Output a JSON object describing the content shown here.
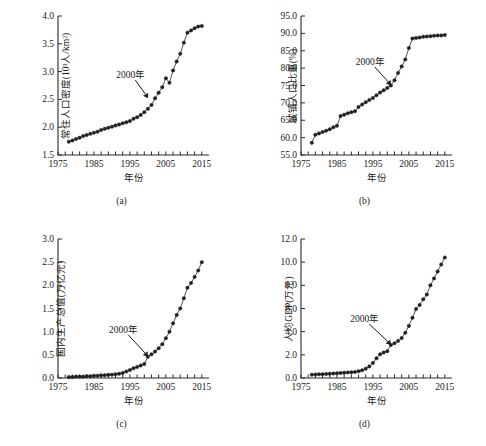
{
  "figure": {
    "panel_captions": [
      "(a)",
      "(b)",
      "(c)",
      "(d)"
    ]
  },
  "chart_data": [
    {
      "type": "scatter",
      "panel": "(a)",
      "title": "",
      "xlabel": "年份",
      "ylabel": "常住人口密度(10³人/km²)",
      "xlim": [
        1975,
        2017
      ],
      "ylim": [
        1.5,
        4.0
      ],
      "xticks": [
        1975,
        1985,
        1995,
        2005,
        2015
      ],
      "xtick_labels": [
        "1975",
        "1985",
        "1995",
        "2005",
        "2015"
      ],
      "yticks": [
        1.5,
        2.0,
        2.5,
        3.0,
        3.5,
        4.0
      ],
      "ytick_labels": [
        "1.5",
        "2.0",
        "2.5",
        "3.0",
        "3.5",
        "4.0"
      ],
      "grid": false,
      "legend": "none",
      "annotations": [
        {
          "text": "2000年",
          "x": 1996.5,
          "y": 2.92,
          "points_to_x": 2000,
          "points_to_y": 2.52
        }
      ],
      "x": [
        1978,
        1979,
        1980,
        1981,
        1982,
        1983,
        1984,
        1985,
        1986,
        1987,
        1988,
        1989,
        1990,
        1991,
        1992,
        1993,
        1994,
        1995,
        1996,
        1997,
        1998,
        1999,
        2000,
        2001,
        2002,
        2003,
        2004,
        2005,
        2006,
        2007,
        2008,
        2009,
        2010,
        2011,
        2012,
        2013,
        2014,
        2015
      ],
      "values": [
        1.74,
        1.76,
        1.79,
        1.81,
        1.84,
        1.86,
        1.88,
        1.9,
        1.92,
        1.95,
        1.97,
        1.99,
        2.01,
        2.03,
        2.05,
        2.07,
        2.09,
        2.11,
        2.15,
        2.18,
        2.22,
        2.27,
        2.33,
        2.4,
        2.52,
        2.62,
        2.72,
        2.88,
        2.8,
        3.02,
        3.18,
        3.32,
        3.52,
        3.7,
        3.74,
        3.78,
        3.81,
        3.82
      ]
    },
    {
      "type": "scatter",
      "panel": "(b)",
      "title": "",
      "xlabel": "年份",
      "ylabel": "城镇人口比重(%)",
      "xlim": [
        1975,
        2017
      ],
      "ylim": [
        55.0,
        95.0
      ],
      "xticks": [
        1975,
        1985,
        1995,
        2005,
        2015
      ],
      "xtick_labels": [
        "1975",
        "1985",
        "1995",
        "2005",
        "2015"
      ],
      "yticks": [
        55.0,
        60.0,
        65.0,
        70.0,
        75.0,
        80.0,
        85.0,
        90.0,
        95.0
      ],
      "ytick_labels": [
        "55.0",
        "60.0",
        "65.0",
        "70.0",
        "75.0",
        "80.0",
        "85.0",
        "90.0",
        "95.0"
      ],
      "grid": false,
      "legend": "none",
      "annotations": [
        {
          "text": "2000年",
          "x": 1995.5,
          "y": 81.5,
          "points_to_x": 2000,
          "points_to_y": 75.0
        }
      ],
      "x": [
        1978,
        1979,
        1980,
        1981,
        1982,
        1983,
        1984,
        1985,
        1986,
        1987,
        1988,
        1989,
        1990,
        1991,
        1992,
        1993,
        1994,
        1995,
        1996,
        1997,
        1998,
        1999,
        2000,
        2001,
        2002,
        2003,
        2004,
        2005,
        2006,
        2007,
        2008,
        2009,
        2010,
        2011,
        2012,
        2013,
        2014,
        2015
      ],
      "values": [
        58.5,
        60.8,
        61.2,
        61.6,
        62.0,
        62.4,
        63.0,
        63.4,
        66.2,
        66.6,
        67.0,
        67.3,
        67.6,
        68.8,
        69.5,
        70.2,
        70.8,
        71.4,
        72.2,
        73.0,
        73.6,
        74.3,
        75.0,
        76.5,
        78.6,
        80.5,
        82.5,
        85.8,
        88.5,
        88.7,
        88.8,
        89.0,
        89.1,
        89.2,
        89.3,
        89.4,
        89.4,
        89.5
      ]
    },
    {
      "type": "scatter",
      "panel": "(c)",
      "title": "",
      "xlabel": "年份",
      "ylabel": "国内生产总值(万亿元)",
      "xlim": [
        1975,
        2017
      ],
      "ylim": [
        0.0,
        3.0
      ],
      "xticks": [
        1975,
        1985,
        1995,
        2005,
        2015
      ],
      "xtick_labels": [
        "1975",
        "1985",
        "1995",
        "2005",
        "2015"
      ],
      "yticks": [
        0.0,
        0.5,
        1.0,
        1.5,
        2.0,
        2.5,
        3.0
      ],
      "ytick_labels": [
        "0.0",
        "0.5",
        "1.0",
        "1.5",
        "2.0",
        "2.5",
        "3.0"
      ],
      "grid": false,
      "legend": "none",
      "annotations": [
        {
          "text": "2000年",
          "x": 1994.5,
          "y": 1.02,
          "points_to_x": 2000,
          "points_to_y": 0.46
        }
      ],
      "x": [
        1978,
        1979,
        1980,
        1981,
        1982,
        1983,
        1984,
        1985,
        1986,
        1987,
        1988,
        1989,
        1990,
        1991,
        1992,
        1993,
        1994,
        1995,
        1996,
        1997,
        1998,
        1999,
        2000,
        2001,
        2002,
        2003,
        2004,
        2005,
        2006,
        2007,
        2008,
        2009,
        2010,
        2011,
        2012,
        2013,
        2014,
        2015
      ],
      "values": [
        0.02,
        0.02,
        0.03,
        0.03,
        0.03,
        0.04,
        0.04,
        0.05,
        0.05,
        0.06,
        0.06,
        0.07,
        0.07,
        0.08,
        0.09,
        0.11,
        0.14,
        0.17,
        0.21,
        0.24,
        0.27,
        0.3,
        0.46,
        0.51,
        0.57,
        0.64,
        0.73,
        0.86,
        1.0,
        1.18,
        1.36,
        1.5,
        1.72,
        1.95,
        2.05,
        2.18,
        2.32,
        2.5
      ]
    },
    {
      "type": "scatter",
      "panel": "(d)",
      "title": "",
      "xlabel": "年份",
      "ylabel": "人均GDP(万元)",
      "xlim": [
        1975,
        2017
      ],
      "ylim": [
        0.0,
        12.0
      ],
      "xticks": [
        1975,
        1985,
        1995,
        2005,
        2015
      ],
      "xtick_labels": [
        "1975",
        "1985",
        "1995",
        "2005",
        "2015"
      ],
      "yticks": [
        0.0,
        2.0,
        4.0,
        6.0,
        8.0,
        10.0,
        12.0
      ],
      "ytick_labels": [
        "0.0",
        "2.0",
        "4.0",
        "6.0",
        "8.0",
        "10.0",
        "12.0"
      ],
      "grid": false,
      "legend": "none",
      "annotations": [
        {
          "text": "2000年",
          "x": 1994.0,
          "y": 5.0,
          "points_to_x": 2000,
          "points_to_y": 2.85
        }
      ],
      "x": [
        1978,
        1979,
        1980,
        1981,
        1982,
        1983,
        1984,
        1985,
        1986,
        1987,
        1988,
        1989,
        1990,
        1991,
        1992,
        1993,
        1994,
        1995,
        1996,
        1997,
        1998,
        1999,
        2000,
        2001,
        2002,
        2003,
        2004,
        2005,
        2006,
        2007,
        2008,
        2009,
        2010,
        2011,
        2012,
        2013,
        2014,
        2015
      ],
      "values": [
        0.28,
        0.3,
        0.32,
        0.33,
        0.35,
        0.37,
        0.39,
        0.41,
        0.43,
        0.46,
        0.48,
        0.5,
        0.52,
        0.58,
        0.66,
        0.8,
        1.0,
        1.3,
        1.7,
        2.05,
        2.2,
        2.32,
        2.85,
        3.0,
        3.2,
        3.45,
        3.9,
        4.5,
        5.2,
        5.95,
        6.3,
        6.8,
        7.2,
        8.0,
        8.6,
        9.2,
        9.8,
        10.4
      ]
    }
  ]
}
